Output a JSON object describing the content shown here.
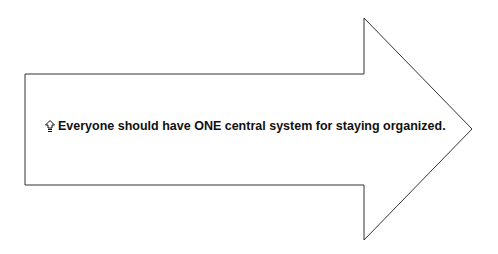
{
  "diagram": {
    "shape": "right-arrow",
    "stroke_color": "#333333",
    "fill_color": "#ffffff",
    "text": "Everyone should have ONE central system for staying organized.",
    "bullet_icon": "up-arrow-outline-icon"
  }
}
